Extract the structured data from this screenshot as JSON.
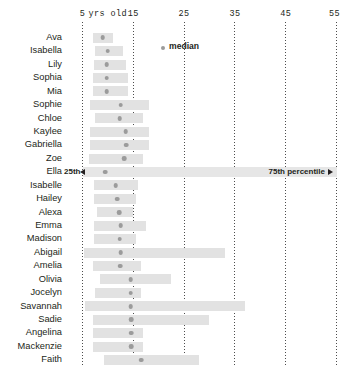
{
  "chart_data": {
    "type": "bar",
    "title": "",
    "subtitle": "",
    "xlabel": "yrs old",
    "ylabel": "",
    "xlim": [
      3,
      58
    ],
    "grid": "vertical-dotted",
    "orientation": "horizontal",
    "bar_meaning": "25th to 75th percentile range",
    "marker_meaning": "median",
    "axis_unit_note": "yrs old",
    "ticks": [
      {
        "label": "5",
        "value": 5
      },
      {
        "label": "15",
        "value": 15
      },
      {
        "label": "25",
        "value": 25
      },
      {
        "label": "35",
        "value": 35
      },
      {
        "label": "45",
        "value": 45
      },
      {
        "label": "55",
        "value": 55
      }
    ],
    "legend": {
      "position": "inside-top",
      "entries": [
        {
          "label": "median",
          "marker": "dot",
          "color": "#9b9b9b"
        }
      ]
    },
    "annotations": [
      {
        "row": "Ella",
        "label": "25th",
        "side": "left",
        "arrow": "left-triangle"
      },
      {
        "row": "Ella",
        "label": "75th percentile",
        "side": "right",
        "arrow": "right-triangle"
      }
    ],
    "categories": [
      "Ava",
      "Isabella",
      "Lily",
      "Sophia",
      "Mia",
      "Sophie",
      "Chloe",
      "Kaylee",
      "Gabriella",
      "Zoe",
      "Ella",
      "Isabelle",
      "Hailey",
      "Alexa",
      "Emma",
      "Madison",
      "Abigail",
      "Amelia",
      "Olivia",
      "Jocelyn",
      "Savannah",
      "Sadie",
      "Angelina",
      "Mackenzie",
      "Faith"
    ],
    "rows": [
      {
        "name": "Ava",
        "p25": 7.0,
        "p75": 11.0,
        "median": 9.0,
        "annotated": false
      },
      {
        "name": "Isabella",
        "p25": 7.5,
        "p75": 13.0,
        "median": 10.0,
        "annotated": false
      },
      {
        "name": "Lily",
        "p25": 7.2,
        "p75": 13.5,
        "median": 9.8,
        "annotated": false
      },
      {
        "name": "Sophia",
        "p25": 7.0,
        "p75": 14.0,
        "median": 9.8,
        "annotated": false
      },
      {
        "name": "Mia",
        "p25": 7.0,
        "p75": 14.0,
        "median": 9.8,
        "annotated": false
      },
      {
        "name": "Sophie",
        "p25": 6.5,
        "p75": 18.0,
        "median": 12.5,
        "annotated": false
      },
      {
        "name": "Chloe",
        "p25": 7.4,
        "p75": 17.0,
        "median": 12.3,
        "annotated": false
      },
      {
        "name": "Kaylee",
        "p25": 6.5,
        "p75": 18.0,
        "median": 13.5,
        "annotated": false
      },
      {
        "name": "Gabriella",
        "p25": 6.5,
        "p75": 18.0,
        "median": 13.6,
        "annotated": false
      },
      {
        "name": "Zoe",
        "p25": 6.2,
        "p75": 17.0,
        "median": 13.2,
        "annotated": false
      },
      {
        "name": "Ella",
        "p25": 5.0,
        "p75": 55.0,
        "median": 9.5,
        "annotated": true
      },
      {
        "name": "Isabelle",
        "p25": 7.3,
        "p75": 16.0,
        "median": 11.5,
        "annotated": false
      },
      {
        "name": "Hailey",
        "p25": 7.3,
        "p75": 15.5,
        "median": 11.8,
        "annotated": false
      },
      {
        "name": "Alexa",
        "p25": 7.8,
        "p75": 15.0,
        "median": 12.2,
        "annotated": false
      },
      {
        "name": "Emma",
        "p25": 7.3,
        "p75": 17.5,
        "median": 12.5,
        "annotated": false
      },
      {
        "name": "Madison",
        "p25": 7.3,
        "p75": 15.5,
        "median": 12.3,
        "annotated": false
      },
      {
        "name": "Abigail",
        "p25": 5.2,
        "p75": 33.0,
        "median": 12.5,
        "annotated": false
      },
      {
        "name": "Amelia",
        "p25": 7.0,
        "p75": 16.5,
        "median": 12.4,
        "annotated": false
      },
      {
        "name": "Olivia",
        "p25": 8.5,
        "p75": 22.5,
        "median": 14.5,
        "annotated": false
      },
      {
        "name": "Jocelyn",
        "p25": 7.5,
        "p75": 16.5,
        "median": 14.5,
        "annotated": false
      },
      {
        "name": "Savannah",
        "p25": 5.5,
        "p75": 37.0,
        "median": 14.5,
        "annotated": false
      },
      {
        "name": "Sadie",
        "p25": 7.0,
        "p75": 30.0,
        "median": 14.6,
        "annotated": false
      },
      {
        "name": "Angelina",
        "p25": 7.0,
        "p75": 17.0,
        "median": 14.6,
        "annotated": false
      },
      {
        "name": "Mackenzie",
        "p25": 7.0,
        "p75": 17.0,
        "median": 14.6,
        "annotated": false
      },
      {
        "name": "Faith",
        "p25": 9.3,
        "p75": 28.0,
        "median": 16.5,
        "annotated": false
      }
    ]
  },
  "axis": {
    "yrs_label": "yrs old"
  },
  "legend": {
    "median_label": "median"
  },
  "annotation": {
    "p25_label": "25th",
    "p75_label": "75th percentile"
  }
}
